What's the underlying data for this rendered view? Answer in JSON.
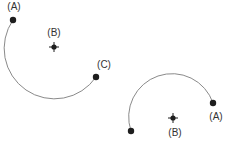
{
  "colors": {
    "arc": "#8a8a8a",
    "dot": "#1e1e1e",
    "label": "#333333",
    "background": "#ffffff"
  },
  "diagrams": [
    {
      "name": "left-arc-diagram",
      "center": {
        "x": 54,
        "y": 47,
        "label": "(B)",
        "label_x": 54,
        "label_y": 36
      },
      "radius": 50,
      "start": {
        "x": 13,
        "y": 20,
        "label": "(A)",
        "label_x": 14,
        "label_y": 10
      },
      "end": {
        "x": 96,
        "y": 77,
        "label": "(C)",
        "label_x": 104,
        "label_y": 68
      },
      "arc_path": "M 13 20 A 50 50 0 1 0 96 77"
    },
    {
      "name": "right-arc-diagram",
      "center": {
        "x": 173,
        "y": 118,
        "label": "(B)",
        "label_x": 175,
        "label_y": 136
      },
      "radius": 43,
      "start": {
        "x": 131,
        "y": 131,
        "label": ""
      },
      "end": {
        "x": 213,
        "y": 103,
        "label": "(A)",
        "label_x": 216,
        "label_y": 120
      },
      "arc_path": "M 131 131 A 43 43 0 1 1 213 103"
    }
  ]
}
